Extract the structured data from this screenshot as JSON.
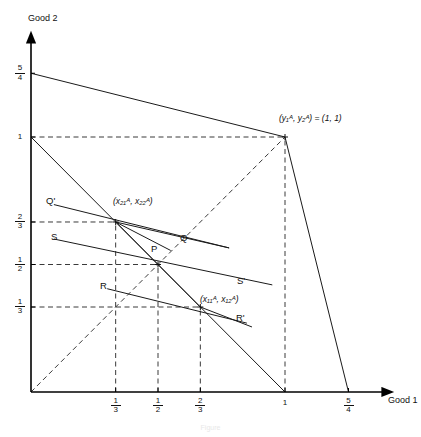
{
  "figure": {
    "caption": "Figure",
    "axes": {
      "x_label": "Good 1",
      "y_label": "Good 2",
      "x_ticks": [
        {
          "label_num": "1",
          "label_den": "3",
          "value": 0.3333
        },
        {
          "label_num": "1",
          "label_den": "2",
          "value": 0.5
        },
        {
          "label_num": "2",
          "label_den": "3",
          "value": 0.6667
        },
        {
          "label_num": "1",
          "label_den": "",
          "value": 1.0
        },
        {
          "label_num": "5",
          "label_den": "4",
          "value": 1.25
        }
      ],
      "y_ticks": [
        {
          "label_num": "1",
          "label_den": "3",
          "value": 0.3333
        },
        {
          "label_num": "1",
          "label_den": "2",
          "value": 0.5
        },
        {
          "label_num": "2",
          "label_den": "3",
          "value": 0.6667
        },
        {
          "label_num": "1",
          "label_den": "",
          "value": 1.0
        },
        {
          "label_num": "5",
          "label_den": "4",
          "value": 1.25
        }
      ],
      "x_range": [
        0,
        1.5
      ],
      "y_range": [
        0,
        1.45
      ]
    },
    "point_labels": {
      "endowment": "(y₁ᴬ, y₂ᴬ) = (1, 1)",
      "bundle_2": "(x₂₁ᴬ, x₂₂ᴬ)",
      "bundle_1": "(x₁₁ᴬ, x₁₂ᴬ)",
      "P": "P",
      "Q": "Q",
      "Q_prime": "Q'",
      "R": "R",
      "R_prime": "R'",
      "S": "S",
      "S_prime": "S'"
    },
    "points": {
      "P": [
        0.5,
        0.5
      ],
      "bundle_2": [
        0.3333,
        0.6667
      ],
      "bundle_1": [
        0.6667,
        0.3333
      ],
      "endowment": [
        1.0,
        1.0
      ]
    },
    "colors": {
      "line": "#1a1a1a",
      "dashed": "#3a3a3a",
      "axis": "#000000"
    }
  },
  "chart_data": {
    "type": "line",
    "title": "",
    "xlabel": "Good 1",
    "ylabel": "Good 2",
    "xlim": [
      0,
      1.5
    ],
    "ylim": [
      0,
      1.45
    ],
    "grid": false,
    "legend": "none",
    "xtick_labels": [
      "1/3",
      "1/2",
      "2/3",
      "1",
      "5/4"
    ],
    "xtick_values": [
      0.3333,
      0.5,
      0.6667,
      1.0,
      1.25
    ],
    "ytick_labels": [
      "1/3",
      "1/2",
      "2/3",
      "1",
      "5/4"
    ],
    "ytick_values": [
      0.3333,
      0.5,
      0.6667,
      1.0,
      1.25
    ],
    "annotated_points": [
      {
        "name": "endowment",
        "x": 1.0,
        "y": 1.0,
        "label": "(y1A, y2A) = (1, 1)"
      },
      {
        "name": "bundle_2",
        "x": 0.3333,
        "y": 0.6667,
        "label": "(x21A, x22A)"
      },
      {
        "name": "P",
        "x": 0.5,
        "y": 0.5,
        "label": "P"
      },
      {
        "name": "bundle_1",
        "x": 0.6667,
        "y": 0.3333,
        "label": "(x11A, x12A)"
      }
    ],
    "series": [
      {
        "name": "production-frontier-upper",
        "style": "solid",
        "points": [
          [
            0,
            1.25
          ],
          [
            1.0,
            1.0
          ]
        ]
      },
      {
        "name": "production-frontier-lower",
        "style": "solid",
        "points": [
          [
            1.0,
            1.0
          ],
          [
            1.25,
            0
          ]
        ]
      },
      {
        "name": "budget-line-endowment",
        "style": "solid",
        "points": [
          [
            0,
            1.0
          ],
          [
            1.0,
            0
          ]
        ]
      },
      {
        "name": "line-Q-Qprime",
        "style": "solid",
        "points": [
          [
            0.09,
            0.735
          ],
          [
            0.78,
            0.565
          ]
        ]
      },
      {
        "name": "line-S-Sprime",
        "style": "solid",
        "points": [
          [
            0.09,
            0.6
          ],
          [
            0.95,
            0.42
          ]
        ]
      },
      {
        "name": "line-R-Rprime",
        "style": "solid",
        "points": [
          [
            0.3,
            0.405
          ],
          [
            0.85,
            0.27
          ]
        ]
      },
      {
        "name": "ray-P-bundle2",
        "style": "solid",
        "points": [
          [
            0.5,
            0.5
          ],
          [
            0.3333,
            0.6667
          ]
        ]
      },
      {
        "name": "ray-P-bundle1",
        "style": "solid",
        "points": [
          [
            0.5,
            0.5
          ],
          [
            0.6667,
            0.3333
          ]
        ]
      },
      {
        "name": "chord-bundle2-Q",
        "style": "solid",
        "points": [
          [
            0.3333,
            0.6667
          ],
          [
            0.78,
            0.565
          ]
        ]
      },
      {
        "name": "chord-bundle2-P",
        "style": "solid",
        "points": [
          [
            0.3333,
            0.6667
          ],
          [
            0.55,
            0.555
          ]
        ]
      },
      {
        "name": "chord-bundle1-Rprime",
        "style": "solid",
        "points": [
          [
            0.6667,
            0.3333
          ],
          [
            0.87,
            0.255
          ]
        ]
      },
      {
        "name": "diagonal-45",
        "style": "dashed",
        "points": [
          [
            0,
            0
          ],
          [
            1.0,
            1.0
          ]
        ]
      },
      {
        "name": "gridline-y1",
        "style": "dashed",
        "points": [
          [
            0,
            1.0
          ],
          [
            1.0,
            1.0
          ]
        ]
      },
      {
        "name": "gridline-y23",
        "style": "dashed",
        "points": [
          [
            0,
            0.6667
          ],
          [
            0.3333,
            0.6667
          ]
        ]
      },
      {
        "name": "gridline-y12",
        "style": "dashed",
        "points": [
          [
            0,
            0.5
          ],
          [
            0.5,
            0.5
          ]
        ]
      },
      {
        "name": "gridline-y13",
        "style": "dashed",
        "points": [
          [
            0,
            0.3333
          ],
          [
            0.6667,
            0.3333
          ]
        ]
      },
      {
        "name": "gridline-x13",
        "style": "dashed",
        "points": [
          [
            0.3333,
            0
          ],
          [
            0.3333,
            0.6667
          ]
        ]
      },
      {
        "name": "gridline-x12",
        "style": "dashed",
        "points": [
          [
            0.5,
            0
          ],
          [
            0.5,
            0.5
          ]
        ]
      },
      {
        "name": "gridline-x23",
        "style": "dashed",
        "points": [
          [
            0.6667,
            0
          ],
          [
            0.6667,
            0.3333
          ]
        ]
      },
      {
        "name": "gridline-x1",
        "style": "dashed",
        "points": [
          [
            1.0,
            0
          ],
          [
            1.0,
            1.0
          ]
        ]
      }
    ]
  }
}
